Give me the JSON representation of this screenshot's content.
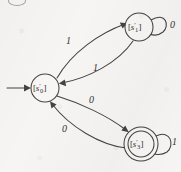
{
  "figure": {
    "type": "state-transition-diagram",
    "title": "",
    "alphabet": [
      "0",
      "1"
    ],
    "ink_color": "#454341",
    "background_color": "#f6f5f3"
  },
  "states": [
    {
      "id": "s0",
      "label_prefix": "[",
      "label_var": "s",
      "label_sub": "0",
      "label_prime": "′",
      "label_suffix": "]",
      "label_text": "[s′0]",
      "accepting": false,
      "start": true,
      "cx": 45,
      "cy": 88,
      "r": 14
    },
    {
      "id": "s1",
      "label_prefix": "[",
      "label_var": "s",
      "label_sub": "1",
      "label_prime": "′",
      "label_suffix": "]",
      "label_text": "[s′1]",
      "accepting": false,
      "start": false,
      "cx": 139,
      "cy": 27,
      "r": 14
    },
    {
      "id": "s3",
      "label_prefix": "[",
      "label_var": "s",
      "label_sub": "3",
      "label_prime": "′",
      "label_suffix": "]",
      "label_text": "[s′3]",
      "accepting": true,
      "start": false,
      "cx": 141,
      "cy": 144,
      "r": 17,
      "r_inner": 13
    }
  ],
  "transitions": [
    {
      "id": "t-s0-s1",
      "from": "s0",
      "to": "s1",
      "symbol": "1",
      "label_x": 66,
      "label_y": 36
    },
    {
      "id": "t-s1-s0",
      "from": "s1",
      "to": "s0",
      "symbol": "1",
      "label_x": 93,
      "label_y": 63
    },
    {
      "id": "t-s0-s3",
      "from": "s0",
      "to": "s3",
      "symbol": "0",
      "label_x": 89,
      "label_y": 95
    },
    {
      "id": "t-s3-s0",
      "from": "s3",
      "to": "s0",
      "symbol": "0",
      "label_x": 62,
      "label_y": 124
    },
    {
      "id": "t-s1-s1",
      "from": "s1",
      "to": "s1",
      "symbol": "0",
      "self_loop": true,
      "label_x": 170,
      "label_y": 20
    },
    {
      "id": "t-s3-s3",
      "from": "s3",
      "to": "s3",
      "symbol": "1",
      "self_loop": true,
      "label_x": 172,
      "label_y": 137
    }
  ],
  "start_marker": {
    "id": "start-arrow",
    "from_x": 7,
    "from_y": 88,
    "to_x": 30,
    "to_y": 88
  }
}
